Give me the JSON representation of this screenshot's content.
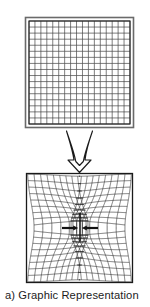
{
  "figure": {
    "caption": "a) Graphic Representation",
    "panels": [
      {
        "id": "undeformed-mesh",
        "label": "undeformed square mesh",
        "frame": {
          "x": 25,
          "y": 17,
          "width": 109,
          "height": 111
        },
        "mesh": {
          "x": 29,
          "y": 21,
          "width": 101,
          "height": 103,
          "columns": 17,
          "rows": 17,
          "distortion": 0
        }
      },
      {
        "id": "deformed-mesh",
        "label": "deformed mesh with central crack under compression",
        "frame": {
          "x": 26,
          "y": 173,
          "width": 107,
          "height": 110
        },
        "mesh": {
          "x": 27,
          "y": 174,
          "width": 105,
          "height": 108,
          "columns": 17,
          "rows": 17,
          "distortion": 1
        }
      }
    ],
    "transform_arrow": {
      "name": "downward-transform-arrow",
      "x": 60,
      "y": 131,
      "width": 38,
      "height": 41,
      "style": "hollow-curved"
    },
    "load_arrows": [
      {
        "name": "compression-arrow-left",
        "direction": "right",
        "x1": 63,
        "y1": 228,
        "x2": 76,
        "y2": 228
      },
      {
        "name": "compression-arrow-right",
        "direction": "left",
        "x1": 97,
        "y1": 228,
        "x2": 84,
        "y2": 228
      }
    ],
    "crack": {
      "name": "center-crack",
      "x": 80,
      "y1": 213,
      "y2": 241
    },
    "colors": {
      "stroke": "#1a1a1a",
      "mesh": "#2b2b2b",
      "frame": "#555555",
      "background": "#ffffff",
      "caption": "#1c1c1c"
    }
  }
}
